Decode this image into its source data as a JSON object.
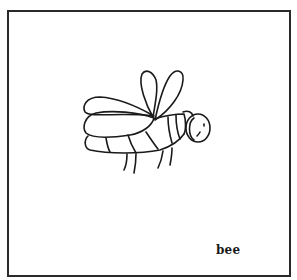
{
  "card": {
    "caption": "bee",
    "illustration": "bee-line-drawing",
    "stroke_color": "#1a1a1a",
    "border_color": "#2a2a2a",
    "background": "#ffffff"
  }
}
